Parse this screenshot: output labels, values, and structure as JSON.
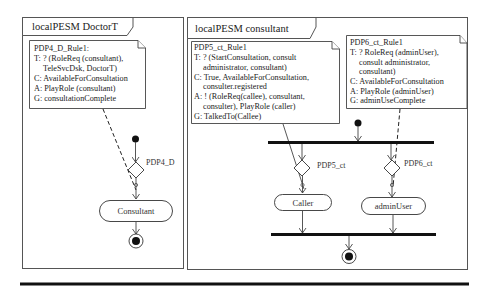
{
  "diagram": {
    "left_frame": {
      "title": "localPESM DoctorT",
      "note": {
        "lines": [
          "PDP4_D_Rule1:",
          "T: ? (RoleReq (consultant),",
          "    TeleSvcDsk, DoctorT)",
          "C: AvailableForConsultation",
          "A: PlayRole (consultant)",
          "G: consultationComplete"
        ]
      },
      "decision_label": "PDP4_D",
      "actions": [
        "Consultant"
      ]
    },
    "right_frame": {
      "title": "localPESM consultant",
      "notes": [
        {
          "lines": [
            "PDP5_ct_Rule1",
            "T: ? (StartConsultation, consult",
            "    administrator, consultant)",
            "C: True, AvailableForConsultation,",
            "    consulter.registered",
            "A: ! (RoleReq(callee), consultant,",
            "    consulter), PlayRole (caller)",
            "G: TalkedTo(Callee)"
          ]
        },
        {
          "lines": [
            "PDP6_ct_Rule1",
            "T: ? RoleReq (adminUser),",
            "    consult administrator,",
            "    consultant)",
            "C: AvailableForConsultation",
            "A: PlayRole (adminUser)",
            "G: adminUseComplete"
          ]
        }
      ],
      "decision_labels": [
        "PDP5_ct",
        "PDP6_ct"
      ],
      "actions": [
        "Caller",
        "adminUser"
      ]
    }
  }
}
